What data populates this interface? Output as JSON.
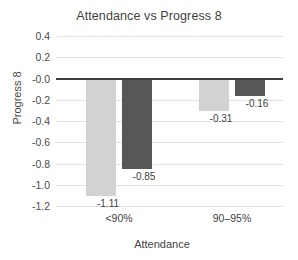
{
  "chart_data": {
    "type": "bar",
    "title": "Attendance vs Progress 8",
    "xlabel": "Attendance",
    "ylabel": "Progress 8",
    "categories": [
      "<90%",
      "90–95%"
    ],
    "series": [
      {
        "name": "series-1",
        "color": "#d2d2d2",
        "values": [
          -1.11,
          -0.31
        ]
      },
      {
        "name": "series-2",
        "color": "#575757",
        "values": [
          -0.85,
          -0.16
        ]
      }
    ],
    "data_labels": [
      "-1.11",
      "-0.85",
      "-0.31",
      "-0.16"
    ],
    "ylim": [
      -1.2,
      0.4
    ],
    "yticks": [
      0.4,
      0.2,
      -0.0,
      -0.2,
      -0.4,
      -0.6,
      -0.8,
      -1.0,
      -1.2
    ],
    "ytick_labels": [
      "0.4",
      "0.2",
      "-0.0",
      "-0.2",
      "-0.4",
      "-0.6",
      "-0.8",
      "-1.0",
      "-1.2"
    ],
    "grid": true,
    "legend": "none",
    "zero_line": true,
    "background": "#ffffff"
  }
}
